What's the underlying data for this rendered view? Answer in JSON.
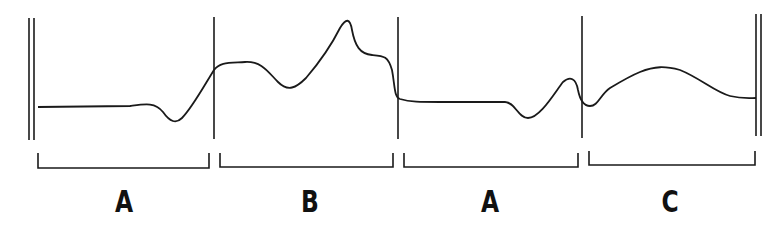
{
  "diagram": {
    "type": "musical-form-contour",
    "form": "ABAC",
    "stroke_color": "#1a1a1a",
    "sections": [
      {
        "label": "A",
        "x_start": 38,
        "x_end": 209,
        "label_x": 124
      },
      {
        "label": "B",
        "x_start": 220,
        "x_end": 393,
        "label_x": 310
      },
      {
        "label": "A",
        "x_start": 404,
        "x_end": 578,
        "label_x": 490
      },
      {
        "label": "C",
        "x_start": 589,
        "x_end": 755,
        "label_x": 670
      }
    ],
    "barlines": {
      "start_double": [
        29,
        34
      ],
      "section_dividers": [
        214,
        398,
        582
      ],
      "end_double": [
        756,
        761
      ]
    }
  }
}
